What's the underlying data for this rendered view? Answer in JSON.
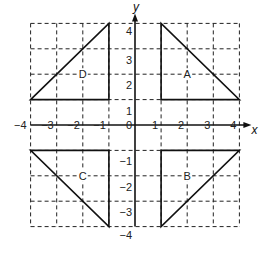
{
  "diagram": {
    "type": "coordinate-grid",
    "x_axis": {
      "label": "x",
      "min": -4,
      "max": 4,
      "ticks": [
        "-4",
        "-3",
        "-2",
        "-1",
        "0",
        "1",
        "2",
        "3",
        "4"
      ]
    },
    "y_axis": {
      "label": "y",
      "min": -4,
      "max": 4,
      "ticks": [
        "-4",
        "-3",
        "-2",
        "-1",
        "1",
        "2",
        "3",
        "4"
      ]
    },
    "grid": {
      "style": "dashed",
      "step": 1
    },
    "shapes": [
      {
        "label": "A",
        "vertices": [
          [
            1,
            4
          ],
          [
            1,
            1
          ],
          [
            4,
            1
          ]
        ],
        "label_at": [
          2,
          2
        ]
      },
      {
        "label": "B",
        "vertices": [
          [
            1,
            -1
          ],
          [
            4,
            -1
          ],
          [
            1,
            -4
          ]
        ],
        "label_at": [
          2,
          -2
        ]
      },
      {
        "label": "C",
        "vertices": [
          [
            -4,
            -1
          ],
          [
            -1,
            -1
          ],
          [
            -1,
            -4
          ]
        ],
        "label_at": [
          -2,
          -2
        ]
      },
      {
        "label": "D",
        "vertices": [
          [
            -4,
            1
          ],
          [
            -1,
            4
          ],
          [
            -1,
            1
          ]
        ],
        "label_at": [
          -2,
          2
        ]
      }
    ]
  }
}
